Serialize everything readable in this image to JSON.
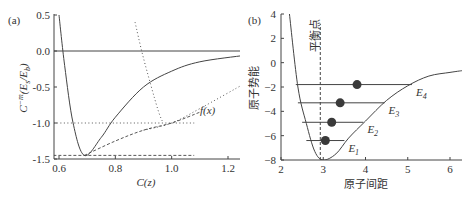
{
  "chart_data": [
    {
      "panel": "(a)",
      "type": "line",
      "xlabel": "C(z)",
      "ylabel": "C^-m(E_s/E_b)",
      "xlim": [
        0.58,
        1.26
      ],
      "ylim": [
        -1.5,
        0.5
      ],
      "xticks": [
        "0.6",
        "0.8",
        "1.0",
        "1.2"
      ],
      "yticks": [
        "0.5",
        "0.0",
        "-0.5",
        "-1.0",
        "-1.5"
      ],
      "annotations": [
        "f(x)"
      ],
      "series": [
        {
          "name": "energy curve",
          "style": "solid",
          "x": [
            0.6,
            0.62,
            0.65,
            0.69,
            0.75,
            0.8,
            0.9,
            1.0,
            1.1,
            1.26
          ],
          "y": [
            0.5,
            -0.2,
            -1.0,
            -1.45,
            -1.2,
            -0.92,
            -0.5,
            -0.28,
            -0.15,
            -0.06
          ]
        },
        {
          "name": "f(x)",
          "style": "dashed",
          "x": [
            0.69,
            0.8,
            0.9,
            1.0,
            1.1
          ],
          "y": [
            -1.45,
            -1.25,
            -1.1,
            -1.0,
            -0.85
          ]
        },
        {
          "name": "dotted steep",
          "style": "dotted",
          "x": [
            0.87,
            0.9,
            0.95,
            0.97
          ],
          "y": [
            0.4,
            -0.1,
            -0.8,
            -1.0
          ]
        },
        {
          "name": "dotted rising",
          "style": "dotted",
          "x": [
            0.9,
            1.0,
            1.1,
            1.26
          ],
          "y": [
            -1.1,
            -1.0,
            -0.8,
            -0.45
          ]
        },
        {
          "name": "y=-1.0 reference",
          "style": "dotted",
          "x": [
            0.58,
            1.08
          ],
          "y": [
            -1.0,
            -1.0
          ]
        },
        {
          "name": "y=-1.45 reference",
          "style": "dashed",
          "x": [
            0.58,
            1.08
          ],
          "y": [
            -1.45,
            -1.45
          ]
        },
        {
          "name": "zero line",
          "style": "solid",
          "x": [
            0.58,
            1.26
          ],
          "y": [
            0,
            0
          ]
        }
      ]
    },
    {
      "panel": "(b)",
      "type": "line",
      "xlabel": "原子间距",
      "ylabel": "原子势能",
      "xlim": [
        2,
        6.3
      ],
      "ylim": [
        -8,
        4
      ],
      "xticks": [
        "2",
        "3",
        "4",
        "5",
        "6"
      ],
      "yticks": [
        "4",
        "2",
        "0",
        "-2",
        "-4",
        "-6",
        "-8"
      ],
      "annotations": [
        "平衡点",
        "E1",
        "E2",
        "E3",
        "E4"
      ],
      "series": [
        {
          "name": "potential curve",
          "style": "solid",
          "x": [
            2.2,
            2.4,
            2.6,
            2.8,
            3.0,
            3.3,
            3.6,
            4.0,
            4.5,
            5.0,
            5.5,
            6.0,
            6.3
          ],
          "y": [
            4,
            -2,
            -5,
            -7.3,
            -8,
            -7.5,
            -6.2,
            -4.8,
            -3.1,
            -1.9,
            -1.1,
            -0.8,
            -0.65
          ]
        },
        {
          "name": "equilibrium line",
          "style": "dashed",
          "x": [
            2.93,
            2.93
          ],
          "y": [
            -8,
            3.2
          ]
        }
      ],
      "energy_levels": [
        {
          "label": "E1",
          "y": -6.4,
          "x_left": 2.6,
          "x_right": 3.5,
          "ball_x": 3.05
        },
        {
          "label": "E2",
          "y": -4.9,
          "x_left": 2.5,
          "x_right": 3.95,
          "ball_x": 3.2
        },
        {
          "label": "E3",
          "y": -3.3,
          "x_left": 2.4,
          "x_right": 4.45,
          "ball_x": 3.4
        },
        {
          "label": "E4",
          "y": -1.8,
          "x_left": 2.35,
          "x_right": 5.1,
          "ball_x": 3.8
        }
      ]
    }
  ],
  "panels": {
    "a": {
      "label": "(a)",
      "xlabel": "C(z)",
      "ylabel": "C^-m(E_s/E_b)",
      "fx_label": "f(x)"
    },
    "b": {
      "label": "(b)",
      "xlabel": "原子间距",
      "ylabel": "原子势能",
      "eq_label": "平衡点"
    }
  }
}
